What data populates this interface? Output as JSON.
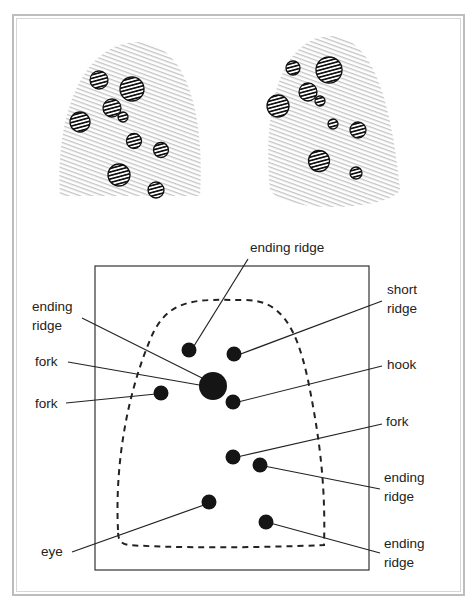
{
  "figure": {
    "type": "fingerprint-minutiae-diagram",
    "fingerprints": [
      {
        "name": "left-fingerprint",
        "marked_circles": 10
      },
      {
        "name": "right-fingerprint",
        "marked_circles": 9
      }
    ],
    "colors": {
      "frame": "#bdbdbd",
      "ink": "#1a1a1a",
      "print": "#c8c8c8"
    }
  },
  "labels": {
    "ending_ridge_top": "ending ridge",
    "ending_ridge_left": "ending\nridge",
    "fork_left_1": "fork",
    "fork_left_2": "fork",
    "eye": "eye",
    "short_ridge": "short\nridge",
    "hook": "hook",
    "fork_right": "fork",
    "ending_ridge_right_1": "ending\nridge",
    "ending_ridge_right_2": "ending\nridge"
  }
}
